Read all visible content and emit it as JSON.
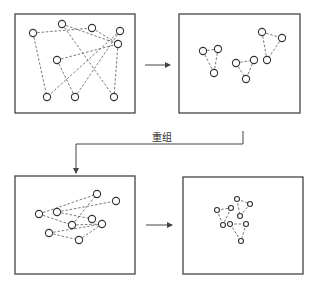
{
  "diagram": {
    "label_regroup": "重组",
    "colors": {
      "line": "#444444",
      "dash": "#555555",
      "node_stroke": "#333333",
      "node_fill": "#ffffff"
    },
    "panels": [
      {
        "id": "top-left",
        "box": [
          15,
          14,
          120,
          99
        ],
        "nodes": [
          [
            33,
            33
          ],
          [
            62,
            24
          ],
          [
            92,
            28
          ],
          [
            120,
            31
          ],
          [
            118,
            44
          ],
          [
            57,
            60
          ],
          [
            47,
            97
          ],
          [
            75,
            97
          ],
          [
            114,
            97
          ]
        ],
        "edges": [
          [
            0,
            2
          ],
          [
            1,
            4
          ],
          [
            2,
            4
          ],
          [
            0,
            6
          ],
          [
            1,
            8
          ],
          [
            3,
            6
          ],
          [
            3,
            7
          ],
          [
            5,
            4
          ],
          [
            5,
            7
          ],
          [
            4,
            8
          ]
        ]
      },
      {
        "id": "top-right",
        "box": [
          179,
          14,
          121,
          99
        ],
        "nodes": [
          [
            203,
            51
          ],
          [
            218,
            49
          ],
          [
            214,
            73
          ],
          [
            236,
            63
          ],
          [
            254,
            60
          ],
          [
            246,
            79
          ],
          [
            262,
            32
          ],
          [
            282,
            38
          ],
          [
            267,
            60
          ]
        ],
        "edges": [
          [
            0,
            1
          ],
          [
            0,
            2
          ],
          [
            1,
            2
          ],
          [
            3,
            4
          ],
          [
            3,
            5
          ],
          [
            4,
            5
          ],
          [
            6,
            7
          ],
          [
            6,
            8
          ],
          [
            7,
            8
          ]
        ]
      },
      {
        "id": "bottom-left",
        "box": [
          15,
          176,
          120,
          98
        ],
        "nodes": [
          [
            39,
            214
          ],
          [
            57,
            212
          ],
          [
            97,
            194
          ],
          [
            116,
            201
          ],
          [
            92,
            219
          ],
          [
            72,
            225
          ],
          [
            102,
            224
          ],
          [
            49,
            233
          ],
          [
            79,
            240
          ]
        ],
        "edges": [
          [
            0,
            2
          ],
          [
            1,
            3
          ],
          [
            1,
            4
          ],
          [
            0,
            5
          ],
          [
            5,
            2
          ],
          [
            5,
            6
          ],
          [
            7,
            6
          ],
          [
            7,
            8
          ],
          [
            8,
            6
          ]
        ]
      },
      {
        "id": "bottom-right",
        "box": [
          183,
          177,
          120,
          97
        ],
        "nodes": [
          [
            217,
            210
          ],
          [
            231,
            208
          ],
          [
            223,
            225
          ],
          [
            237,
            199
          ],
          [
            250,
            204
          ],
          [
            240,
            216
          ],
          [
            230,
            224
          ],
          [
            246,
            224
          ],
          [
            241,
            241
          ]
        ],
        "edges": [
          [
            0,
            1
          ],
          [
            0,
            2
          ],
          [
            1,
            2
          ],
          [
            3,
            4
          ],
          [
            3,
            5
          ],
          [
            4,
            5
          ],
          [
            6,
            7
          ],
          [
            6,
            8
          ],
          [
            7,
            8
          ]
        ]
      }
    ],
    "arrows": [
      {
        "id": "arrow-top",
        "from": [
          145,
          65
        ],
        "to": [
          170,
          65
        ]
      },
      {
        "id": "arrow-bottom",
        "from": [
          146,
          225
        ],
        "to": [
          172,
          225
        ]
      }
    ],
    "regroup_connector": {
      "points": [
        [
          243,
          131
        ],
        [
          243,
          144
        ],
        [
          76,
          144
        ],
        [
          76,
          173
        ]
      ]
    }
  }
}
